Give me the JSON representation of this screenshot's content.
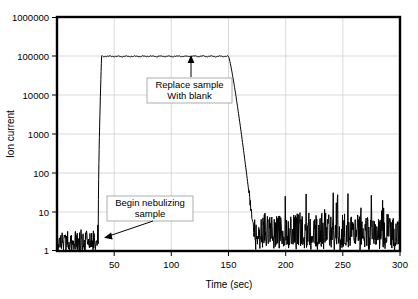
{
  "chart_data": {
    "type": "line",
    "title": "",
    "xlabel": "Time (sec)",
    "ylabel": "Ion current",
    "xlim": [
      0,
      300
    ],
    "ylim": [
      1,
      1000000
    ],
    "yscale": "log",
    "xscale": "linear",
    "grid": true,
    "legend": null,
    "x_ticks": [
      50,
      100,
      150,
      200,
      250,
      300
    ],
    "x_tick_labels": [
      "50",
      "100",
      "150",
      "200",
      "250",
      "300"
    ],
    "y_ticks": [
      1,
      10,
      100,
      1000,
      10000,
      100000,
      1000000
    ],
    "y_tick_labels": [
      "1",
      "10",
      "100",
      "1000",
      "10000",
      "100000",
      "1000000"
    ],
    "series": [
      {
        "name": "Ion current",
        "color": "#000000",
        "description": "Noisy baseline near 1-4 counts until nebulization begins at t=36 s; sharp rise to a plateau at about 100000; plateau held until t=150 s; exponential decay back to baseline by t=172 s; noisy baseline 1-10 thereafter.",
        "segments": [
          {
            "label": "baseline-before",
            "t_start": 0,
            "t_end": 36,
            "level": 2.2,
            "noise_low": 1.0,
            "noise_high": 4.5
          },
          {
            "label": "rise",
            "t_start": 36,
            "t_end": 39,
            "from": 1.5,
            "to": 100000
          },
          {
            "label": "plateau",
            "t_start": 39,
            "t_end": 150,
            "level": 100000,
            "noise_low": 88000,
            "noise_high": 115000
          },
          {
            "label": "decay",
            "t_start": 150,
            "t_end": 172,
            "from": 100000,
            "to": 3.0
          },
          {
            "label": "baseline-after",
            "t_start": 172,
            "t_end": 300,
            "level": 3.5,
            "noise_low": 1.0,
            "noise_high": 11.0
          }
        ],
        "key_points": [
          {
            "t": 0,
            "y": 2.0
          },
          {
            "t": 36,
            "y": 1.6
          },
          {
            "t": 38,
            "y": 100000
          },
          {
            "t": 60,
            "y": 102000
          },
          {
            "t": 100,
            "y": 101000
          },
          {
            "t": 145,
            "y": 103000
          },
          {
            "t": 150,
            "y": 100000
          },
          {
            "t": 160,
            "y": 1500
          },
          {
            "t": 168,
            "y": 40
          },
          {
            "t": 172,
            "y": 4.0
          },
          {
            "t": 220,
            "y": 4.5
          },
          {
            "t": 260,
            "y": 4.0
          },
          {
            "t": 300,
            "y": 3.5
          }
        ]
      }
    ],
    "annotations": [
      {
        "id": "replace-sample",
        "lines": [
          "Replace sample",
          "With blank"
        ],
        "arrow": "up",
        "points_to_t": 120,
        "points_to_y": 100000
      },
      {
        "id": "begin-nebulizing",
        "lines": [
          "Begin nebulizing",
          "sample"
        ],
        "arrow": "down-left",
        "points_to_t": 36,
        "points_to_y": 3
      }
    ]
  },
  "axes": {
    "x_title": "Time (sec)",
    "y_title": "Ion current"
  }
}
